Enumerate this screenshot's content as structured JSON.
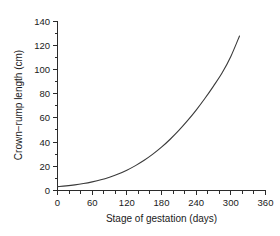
{
  "figure": {
    "background": "#ffffff",
    "line_color": "#3a3a3a",
    "axis_color": "#2b2b2b"
  },
  "chart_data": {
    "type": "line",
    "title": "",
    "subtitle": "",
    "xlabel": "Stage of gestation (days)",
    "ylabel": "Crown−rump length (cm)",
    "xlim": [
      0,
      360
    ],
    "ylim": [
      0,
      140
    ],
    "grid": false,
    "legend": false,
    "legend_position": "none",
    "x_ticks": [
      0,
      60,
      120,
      180,
      240,
      300,
      360
    ],
    "x_tick_labels": [
      "0",
      "60",
      "120",
      "180",
      "240",
      "300",
      "360"
    ],
    "x_minor_step": 20,
    "y_ticks": [
      0,
      20,
      40,
      60,
      80,
      100,
      120,
      140
    ],
    "y_tick_labels": [
      "0",
      "20",
      "40",
      "60",
      "80",
      "100",
      "120",
      "140"
    ],
    "y_minor_step": 10,
    "series": [
      {
        "name": "Crown-rump length",
        "color": "#3a3a3a",
        "x": [
          0,
          15,
          30,
          45,
          60,
          75,
          90,
          105,
          120,
          135,
          150,
          165,
          180,
          195,
          210,
          225,
          240,
          255,
          270,
          285,
          300,
          315
        ],
        "y": [
          3.0,
          3.6,
          4.4,
          5.5,
          6.9,
          8.6,
          10.8,
          13.4,
          16.6,
          20.4,
          24.8,
          29.9,
          35.7,
          42.3,
          49.6,
          57.7,
          66.5,
          76.1,
          86.4,
          97.4,
          111.0,
          128.0
        ]
      }
    ]
  },
  "axis_labels": {
    "y": [
      "140",
      "120",
      "100",
      "80",
      "60",
      "40",
      "20",
      "0"
    ],
    "x": [
      "0",
      "60",
      "120",
      "180",
      "240",
      "300",
      "360"
    ],
    "y_title": "Crown−rump length (cm)",
    "x_title": "Stage of gestation (days)"
  }
}
